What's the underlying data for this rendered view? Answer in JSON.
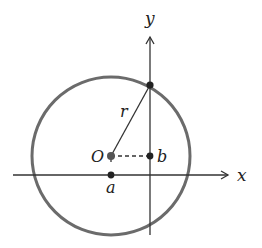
{
  "diagram": {
    "type": "coordinate-geometry",
    "colors": {
      "circle": "#6b6b6b",
      "axes": "#333333",
      "points": "#222222",
      "background": "#ffffff"
    },
    "labels": {
      "x_axis": "x",
      "y_axis": "y",
      "center": "O",
      "radius": "r",
      "a": "a",
      "b": "b"
    }
  }
}
